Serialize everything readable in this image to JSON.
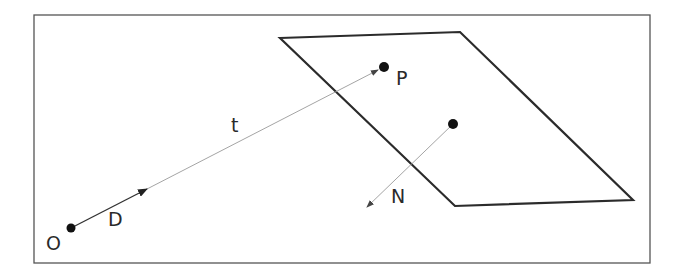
{
  "diagram": {
    "labels": {
      "origin": "O",
      "direction": "D",
      "distance": "t",
      "intersection": "P",
      "normal": "N"
    },
    "colors": {
      "frame": "#555555",
      "plane": "#2b2b2b",
      "ray": "#9a9a9a",
      "direction_vector": "#333333",
      "points": "#111111",
      "text": "#2a2a2a"
    },
    "geometry": {
      "frame": {
        "x": 34,
        "y": 15,
        "width": 616,
        "height": 248
      },
      "plane_points": "280,38 460,32 633,200 455,206",
      "origin_point": {
        "x": 71,
        "y": 228
      },
      "direction_arrow_tip": {
        "x": 147,
        "y": 189
      },
      "intersection_point": {
        "x": 384,
        "y": 67
      },
      "normal_base": {
        "x": 453,
        "y": 124
      },
      "normal_tip": {
        "x": 366,
        "y": 208
      }
    }
  }
}
